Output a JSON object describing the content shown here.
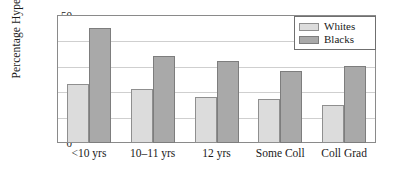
{
  "chart_data": {
    "type": "bar",
    "title": "",
    "xlabel": "",
    "ylabel": "Percentage Hypertensive",
    "categories": [
      "<10 yrs",
      "10–11 yrs",
      "12 yrs",
      "Some Coll",
      "Coll Grad"
    ],
    "series": [
      {
        "name": "Whites",
        "color": "#dcdcdc",
        "values": [
          23,
          21,
          18,
          17,
          15
        ]
      },
      {
        "name": "Blacks",
        "color": "#a9a9a9",
        "values": [
          45,
          34,
          32,
          28,
          30
        ]
      }
    ],
    "ylim": [
      0,
      50
    ],
    "ytick_values": [
      0,
      10,
      20,
      30,
      40,
      50
    ],
    "ytick_labels": [
      "0",
      "10",
      "20",
      "30",
      "40",
      "50"
    ],
    "grid": true,
    "legend_position": "upper-right"
  }
}
